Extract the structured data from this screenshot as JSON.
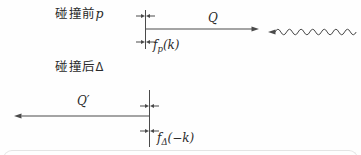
{
  "colors": {
    "line": "#4a4a4a",
    "text": "#2a2a2a",
    "divider": "#e4e4e4"
  },
  "before": {
    "caption_cn": "碰撞前",
    "caption_symbol": "p",
    "transfer_label": "Q",
    "dist_f": "f",
    "dist_sub": "p",
    "dist_args": "(k)"
  },
  "after": {
    "caption_cn": "碰撞后",
    "caption_symbol": "Δ",
    "transfer_label": "Q′",
    "dist_f": "f",
    "dist_sub": "Δ",
    "dist_args": "(−k)"
  }
}
